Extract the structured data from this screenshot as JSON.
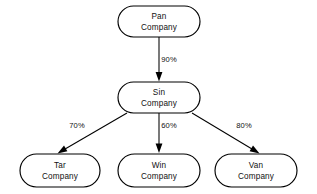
{
  "diagram": {
    "background_color": "#ffffff",
    "stroke_color": "#000000",
    "text_color": "#111111",
    "nodes": [
      {
        "id": "pan",
        "line1": "Pan",
        "line2": "Company",
        "shape": "stadium",
        "x": 118,
        "y": 6,
        "w": 82,
        "h": 31
      },
      {
        "id": "sin",
        "line1": "Sin",
        "line2": "Company",
        "shape": "stadium",
        "x": 118,
        "y": 82,
        "w": 82,
        "h": 31
      },
      {
        "id": "tar",
        "line1": "Tar",
        "line2": "Company",
        "shape": "stadium",
        "x": 20,
        "y": 154,
        "w": 80,
        "h": 33
      },
      {
        "id": "win",
        "line1": "Win",
        "line2": "Company",
        "shape": "stadium",
        "x": 118,
        "y": 154,
        "w": 82,
        "h": 33
      },
      {
        "id": "van",
        "line1": "Van",
        "line2": "Company",
        "shape": "stadium",
        "x": 215,
        "y": 154,
        "w": 82,
        "h": 33
      }
    ],
    "edges": [
      {
        "id": "pan-sin",
        "from": "pan",
        "to": "sin",
        "label": "90%",
        "label_x": 169,
        "label_y": 62,
        "x1": 159,
        "y1": 37,
        "x2": 159,
        "y2": 81,
        "arrow": "down"
      },
      {
        "id": "sin-tar",
        "from": "sin",
        "to": "tar",
        "label": "70%",
        "label_x": 77,
        "label_y": 128,
        "x1": 127,
        "y1": 113,
        "x2": 60,
        "y2": 152,
        "arrow": "diagonal-left"
      },
      {
        "id": "sin-win",
        "from": "sin",
        "to": "win",
        "label": "60%",
        "label_x": 169,
        "label_y": 128,
        "x1": 159,
        "y1": 113,
        "x2": 159,
        "y2": 152,
        "arrow": "down"
      },
      {
        "id": "sin-van",
        "from": "sin",
        "to": "van",
        "label": "80%",
        "label_x": 244,
        "label_y": 128,
        "x1": 192,
        "y1": 113,
        "x2": 257,
        "y2": 152,
        "arrow": "diagonal-right"
      }
    ]
  }
}
